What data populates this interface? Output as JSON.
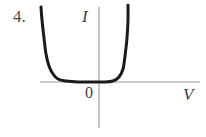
{
  "figure": {
    "item_number": "4.",
    "origin_label": "0",
    "x_axis_label": "V",
    "y_axis_label": "I",
    "axis_color": "#9a9a9a",
    "curve_color": "#1a1a1a",
    "background_color": "#ffffff",
    "text_color": "#3d3d3d"
  },
  "chart_data": {
    "type": "line",
    "title": "",
    "xlabel": "V",
    "ylabel": "I",
    "origin_label": "0",
    "grid": false,
    "legend": null,
    "axes": {
      "x_axis": {
        "label": "V",
        "start_px": [
          40,
          82
        ],
        "end_px": [
          200,
          82
        ],
        "arrow": false,
        "ticks": [],
        "tick_labels": []
      },
      "y_axis": {
        "label": "I",
        "start_px": [
          99,
          7
        ],
        "end_px": [
          99,
          128
        ],
        "arrow": false,
        "ticks": [],
        "tick_labels": []
      }
    },
    "series": [
      {
        "name": "I-V characteristic",
        "description": "U-shaped current-voltage characteristic: large reverse current at strongly negative V, near-zero current over the middle range, steep rise in forward current past a threshold voltage",
        "points_px": [
          [
            41,
            7
          ],
          [
            42,
            20
          ],
          [
            44,
            38
          ],
          [
            46,
            54
          ],
          [
            49,
            66
          ],
          [
            53,
            74
          ],
          [
            58,
            79
          ],
          [
            66,
            81
          ],
          [
            78,
            82
          ],
          [
            92,
            82
          ],
          [
            104,
            82
          ],
          [
            113,
            81
          ],
          [
            119,
            77
          ],
          [
            123,
            69
          ],
          [
            125,
            56
          ],
          [
            127,
            38
          ],
          [
            128,
            20
          ],
          [
            128,
            5
          ]
        ],
        "linewidth_px": 3,
        "color": "#1a1a1a"
      }
    ]
  }
}
